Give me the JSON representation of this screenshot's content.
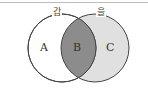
{
  "diagram": {
    "type": "venn",
    "sets": [
      {
        "name": "갑",
        "fill": "#ffffff"
      },
      {
        "name": "을",
        "fill": "#e0e0e0"
      }
    ],
    "regions": [
      {
        "label": "A",
        "fill": "#ffffff"
      },
      {
        "label": "B",
        "fill": "#8c8c8c"
      },
      {
        "label": "C",
        "fill": "#e0e0e0"
      }
    ]
  }
}
